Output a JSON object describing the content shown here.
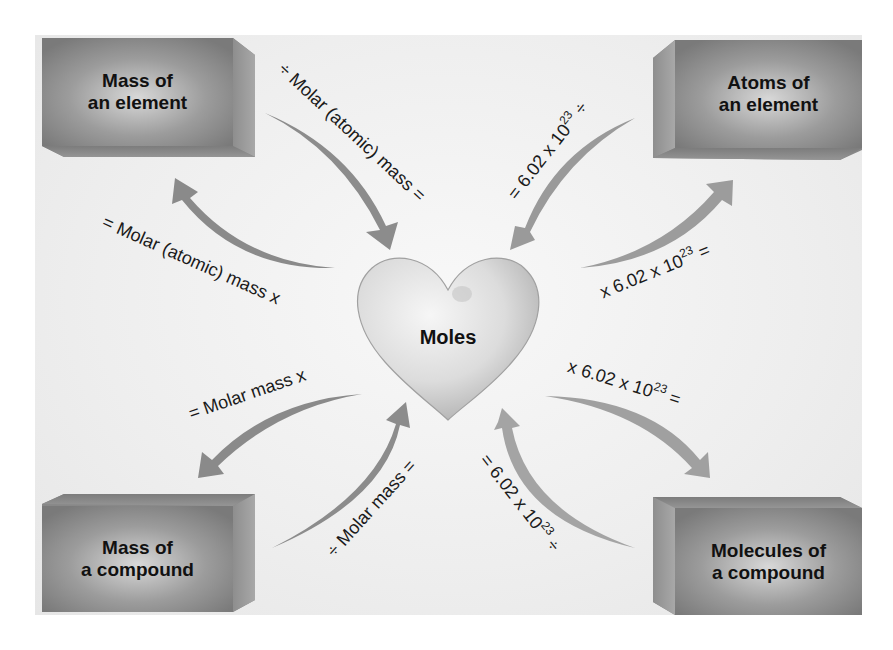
{
  "diagram": {
    "center": {
      "label": "Moles",
      "shape": "heart"
    },
    "boxes": {
      "top_left": {
        "line1": "Mass of",
        "line2": "an element"
      },
      "top_right": {
        "line1": "Atoms of",
        "line2": "an element"
      },
      "bottom_left": {
        "line1": "Mass of",
        "line2": "a compound"
      },
      "bottom_right": {
        "line1": "Molecules of",
        "line2": "a compound"
      }
    },
    "arrows": {
      "tl_to_center": {
        "text": "÷ Molar (atomic) mass ="
      },
      "center_to_tl": {
        "text": "= Molar (atomic) mass x"
      },
      "tr_to_center": {
        "pre": "= 6.02 x 10",
        "exp": "23",
        "post": " ÷"
      },
      "center_to_tr": {
        "pre": "x 6.02 x 10",
        "exp": "23",
        "post": " ="
      },
      "center_to_bl": {
        "text": "= Molar mass x"
      },
      "bl_to_center": {
        "text": "÷ Molar mass ="
      },
      "center_to_br": {
        "pre": "x 6.02 x 10",
        "exp": "23",
        "post": " ="
      },
      "br_to_center": {
        "pre": "= 6.02 x 10",
        "exp": "23",
        "post": " ÷"
      }
    },
    "colors": {
      "background": "#eeeeee",
      "box": "#8a8a8a",
      "arrow": "#8c8c8c",
      "heart": "#d9d9d9",
      "text": "#111111"
    }
  }
}
